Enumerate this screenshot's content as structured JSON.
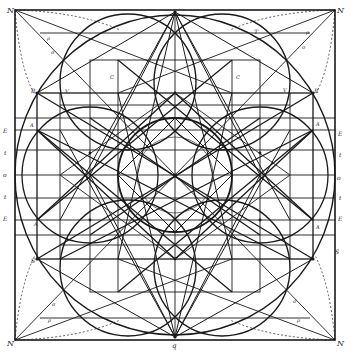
{
  "figure": {
    "type": "geometric construction engraving",
    "stroke_color": "#1a1a1a",
    "background": "#ffffff"
  },
  "labels": {
    "corner_tl": "N",
    "corner_tr": "N",
    "corner_bl": "N",
    "corner_br": "N",
    "top_apex": "T",
    "bottom_apex": "q",
    "left_upper_R": "R",
    "right_upper_R": "R",
    "left_lower_S": "S",
    "right_lower_S": "S",
    "left_E_upper": "E",
    "left_t_upper": "t",
    "left_mid": "o",
    "left_t_lower": "t",
    "left_E_lower": "E",
    "right_E_upper": "E",
    "right_t_upper": "t",
    "right_mid": "o",
    "right_t_lower": "t",
    "right_E_lower": "E",
    "left_A_upper": "A",
    "left_A_lower": "A",
    "right_A_upper": "A",
    "right_A_lower": "A",
    "diag_tl_1": "ρ",
    "diag_tl_2": "σ",
    "diag_tr_1": "ρ",
    "diag_tr_2": "σ",
    "diag_bl_1": "σ",
    "diag_bl_2": "ρ",
    "diag_br_1": "σ",
    "diag_br_2": "ρ",
    "center_V_tl": "V",
    "center_V_tr": "V",
    "center_C_left": "C",
    "center_C_right": "C"
  }
}
